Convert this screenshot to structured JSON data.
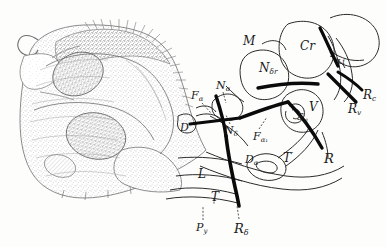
{
  "figure": {
    "background_color": "#fdfdfc",
    "ink_color": "#1a1a1a",
    "stipple_color": "#8d8d8d",
    "outline_color": "#2b2b2b",
    "tract_color": "#0a0a0a",
    "labels": [
      {
        "id": "M",
        "text": "M",
        "x": 243,
        "y": 35,
        "size": 12,
        "leader": false
      },
      {
        "id": "Cr",
        "text": "Cr",
        "x": 300,
        "y": 40,
        "size": 12,
        "leader": false
      },
      {
        "id": "Ndr",
        "text": "N",
        "sub": "δr",
        "x": 259,
        "y": 62,
        "size": 12,
        "leader": false
      },
      {
        "id": "Li",
        "text": "Li",
        "x": 337,
        "y": 58,
        "size": 8,
        "leader": false
      },
      {
        "id": "Rc",
        "text": "R",
        "sub": "c",
        "x": 363,
        "y": 89,
        "size": 12,
        "leader": false
      },
      {
        "id": "Rv",
        "text": "R",
        "sub": "v",
        "x": 348,
        "y": 103,
        "size": 12,
        "leader": false
      },
      {
        "id": "Fa",
        "text": "F",
        "sub": "α",
        "x": 191,
        "y": 90,
        "size": 11,
        "leader": true,
        "leader_path": "M 202 103 L 211 113"
      },
      {
        "id": "Na",
        "text": "N",
        "sub": "α",
        "x": 216,
        "y": 80,
        "size": 11,
        "leader": true,
        "leader_path": "M 223 92 L 226 103"
      },
      {
        "id": "D",
        "text": "D",
        "x": 180,
        "y": 122,
        "size": 11,
        "leader": false
      },
      {
        "id": "Nd",
        "text": "N",
        "sub": "δ",
        "x": 224,
        "y": 125,
        "size": 11,
        "leader": true,
        "leader_path": "M 230 124 L 226 115"
      },
      {
        "id": "Fa1",
        "text": "F",
        "sub": "α₁",
        "x": 253,
        "y": 131,
        "size": 11,
        "leader": true,
        "leader_path": "M 259 129 L 267 117"
      },
      {
        "id": "V",
        "text": "V",
        "x": 309,
        "y": 101,
        "size": 12,
        "leader": false
      },
      {
        "id": "Sg",
        "text": "S",
        "sub": "g",
        "x": 297,
        "y": 112,
        "size": 10,
        "leader": false
      },
      {
        "id": "Da",
        "text": "D",
        "sub": "α",
        "x": 245,
        "y": 154,
        "size": 11,
        "leader": false
      },
      {
        "id": "Tp",
        "text": "T",
        "prime": "′",
        "x": 283,
        "y": 151,
        "size": 12,
        "leader": false
      },
      {
        "id": "R",
        "text": "R",
        "x": 324,
        "y": 152,
        "size": 13,
        "leader": false
      },
      {
        "id": "L",
        "text": "L",
        "x": 198,
        "y": 168,
        "size": 12,
        "leader": false
      },
      {
        "id": "T",
        "text": "T",
        "x": 211,
        "y": 191,
        "size": 12,
        "leader": true,
        "leader_path": "M 214 198 L 214 205"
      },
      {
        "id": "Py",
        "text": "P",
        "sub": "y",
        "x": 196,
        "y": 222,
        "size": 11,
        "leader": true,
        "leader_path": "M 203 220 L 203 206"
      },
      {
        "id": "Rd",
        "text": "R",
        "sub": "δ",
        "x": 234,
        "y": 222,
        "size": 13,
        "leader": true,
        "leader_path": "M 239 219 L 237 206"
      }
    ],
    "tracts": [
      {
        "id": "tract-main-left",
        "desc": "heavy black descending fibre bundle, upper-left curve"
      },
      {
        "id": "tract-main-lower",
        "desc": "heavy black fibre bundle descending to R-delta"
      },
      {
        "id": "tract-horizontal",
        "desc": "heavy black horizontal band through N-delta-r"
      },
      {
        "id": "tract-right",
        "desc": "heavy black band descending to R"
      },
      {
        "id": "tract-rc",
        "desc": "short heavy band to Rc"
      },
      {
        "id": "tract-rv",
        "desc": "short heavy band to Rv"
      }
    ]
  }
}
